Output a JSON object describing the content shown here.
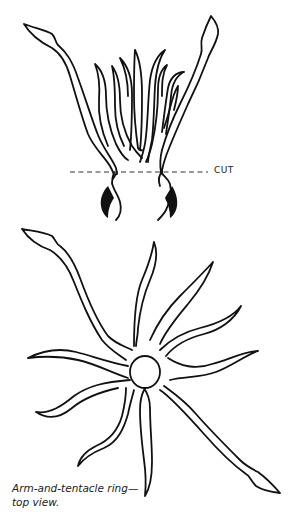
{
  "figure": {
    "top_view_label": "side view (cut section)",
    "cut_label": "CUT",
    "caption_line1": "Arm-and-tentacle ring—",
    "caption_line2": "top view."
  },
  "colors": {
    "stroke": "#111111",
    "background": "#ffffff"
  }
}
